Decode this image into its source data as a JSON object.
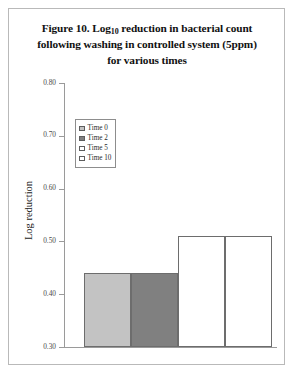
{
  "figure": {
    "title_line1_prefix": "Figure 10. Log",
    "title_line1_sub": "10",
    "title_line1_suffix": " reduction in bacterial count",
    "title_line2": "following washing in controlled system (5ppm)",
    "title_line3": "for various times"
  },
  "chart_data": {
    "type": "bar",
    "title": "Figure 10. Log10 reduction in bacterial count following washing in controlled system (5ppm) for various times",
    "categories": [
      "Time 0",
      "Time 2",
      "Time 5",
      "Time 10"
    ],
    "values": [
      0.44,
      0.44,
      0.51,
      0.51
    ],
    "series": [
      {
        "name": "Log reduction",
        "values": [
          0.44,
          0.44,
          0.51,
          0.51
        ]
      }
    ],
    "xlabel": "",
    "ylabel": "Log reduction",
    "ylim": [
      0.3,
      0.8
    ],
    "yticks": [
      0.8,
      0.7,
      0.6,
      0.5,
      0.4,
      0.3
    ],
    "ytick_labels": [
      "0.80",
      "0.70",
      "0.60",
      "0.50",
      "0.40",
      "0.30"
    ],
    "grid": false,
    "legend_position": "upper-left-inside",
    "bar_colors": [
      "#c3c3c3",
      "#808080",
      "#ffffff",
      "#ffffff"
    ],
    "bar_edge_color": "#6d6d6d"
  },
  "axis": {
    "y_title": "Log reduction",
    "ticks": [
      {
        "label": "0.80",
        "value": 0.8
      },
      {
        "label": "0.70",
        "value": 0.7
      },
      {
        "label": "0.60",
        "value": 0.6
      },
      {
        "label": "0.50",
        "value": 0.5
      },
      {
        "label": "0.40",
        "value": 0.4
      },
      {
        "label": "0.30",
        "value": 0.3
      }
    ]
  },
  "legend": {
    "items": [
      {
        "label": "Time 0",
        "color": "#c3c3c3"
      },
      {
        "label": "Time 2",
        "color": "#808080"
      },
      {
        "label": "Time 5",
        "color": "#ffffff"
      },
      {
        "label": "Time 10",
        "color": "#ffffff"
      }
    ]
  }
}
